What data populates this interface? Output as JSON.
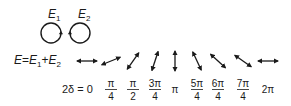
{
  "fields": {
    "e1_label": "E",
    "e1_sub": "1",
    "e2_label": "E",
    "e2_sub": "2"
  },
  "equation": {
    "lhs": "E",
    "eq": "=",
    "t1": "E",
    "t1_sub": "1",
    "plus": "+",
    "t2": "E",
    "t2_sub": "2"
  },
  "phase_label": {
    "prefix": "2δ = 0"
  },
  "polarizations": [
    {
      "phase": "0",
      "num": "",
      "den": "",
      "angle_deg": 0,
      "x": 87
    },
    {
      "phase": "π/4",
      "num": "π",
      "den": "4",
      "angle_deg": -22,
      "x": 111
    },
    {
      "phase": "π/2",
      "num": "π",
      "den": "2",
      "angle_deg": -55,
      "x": 133
    },
    {
      "phase": "3π/4",
      "num": "3π",
      "den": "4",
      "angle_deg": -72,
      "x": 155
    },
    {
      "phase": "π",
      "num": "π",
      "den": "",
      "angle_deg": 90,
      "x": 175
    },
    {
      "phase": "5π/4",
      "num": "5π",
      "den": "4",
      "angle_deg": 65,
      "x": 197
    },
    {
      "phase": "6π/4",
      "num": "6π",
      "den": "4",
      "angle_deg": 42,
      "x": 218
    },
    {
      "phase": "7π/4",
      "num": "7π",
      "den": "4",
      "angle_deg": 35,
      "x": 243
    },
    {
      "phase": "2π",
      "num": "2π",
      "den": "",
      "angle_deg": 0,
      "x": 268
    }
  ],
  "colors": {
    "ink": "#1a1a1a",
    "background": "#ffffff"
  }
}
